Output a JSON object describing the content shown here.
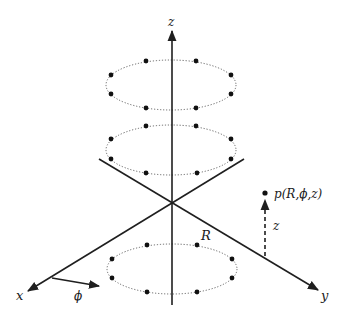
{
  "diagram": {
    "axes": {
      "x_label": "x",
      "y_label": "y",
      "z_label": "z",
      "origin": [
        172,
        203
      ]
    },
    "angle_label": "ϕ",
    "radius_label": "R",
    "point": {
      "label": "p(R,ϕ,z)",
      "height_label": "z"
    },
    "rings": [
      {
        "name": "upper-ring",
        "center": [
          171,
          85
        ],
        "rx": 65,
        "ry": 25,
        "points": 8
      },
      {
        "name": "middle-ring",
        "center": [
          171,
          150
        ],
        "rx": 65,
        "ry": 25,
        "points": 8
      },
      {
        "name": "lower-ring",
        "center": [
          172,
          269
        ],
        "rx": 65,
        "ry": 25,
        "points": 8
      }
    ],
    "colors": {
      "line": "#1f1f1f",
      "dot": "#111111",
      "ring": "#555555",
      "background": "#ffffff"
    }
  }
}
